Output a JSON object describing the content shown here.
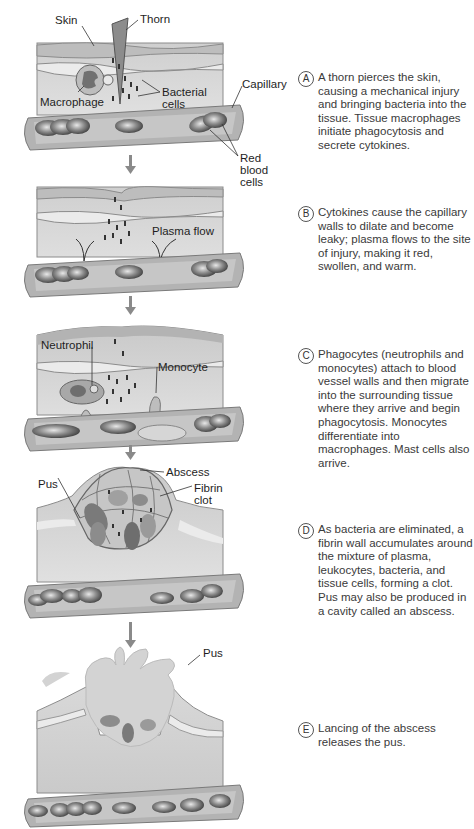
{
  "steps": [
    {
      "letter": "A",
      "text": "A thorn pierces the skin, causing a mechanical injury and bringing bacteria into the tissue. Tissue macrophages initiate phagocytosis and secrete cytokines.",
      "labels": {
        "skin": "Skin",
        "thorn": "Thorn",
        "macrophage": "Macrophage",
        "bacterial_cells": "Bacterial\ncells",
        "capillary": "Capillary",
        "red_blood_cells": "Red blood\ncells"
      }
    },
    {
      "letter": "B",
      "text": "Cytokines cause the capillary walls to dilate and become leaky; plasma flows to the site of injury, making it red, swollen, and warm.",
      "labels": {
        "plasma_flow": "Plasma flow"
      }
    },
    {
      "letter": "C",
      "text": "Phagocytes (neutrophils and monocytes) attach to blood vessel walls and then migrate into the surrounding tissue where they arrive and begin phagocytosis. Monocytes differentiate into macrophages. Mast cells also arrive.",
      "labels": {
        "neutrophil": "Neutrophil",
        "monocyte": "Monocyte"
      }
    },
    {
      "letter": "D",
      "text": "As bacteria are eliminated, a fibrin wall accumulates around the mixture of plasma, leukocytes, bacteria, and tissue cells, forming a clot. Pus may also be produced in a cavity called an abscess.",
      "labels": {
        "pus": "Pus",
        "abscess": "Abscess",
        "fibrin_clot": "Fibrin\nclot"
      }
    },
    {
      "letter": "E",
      "text": "Lancing of the abscess releases the pus.",
      "labels": {
        "pus": "Pus"
      }
    }
  ],
  "colors": {
    "tissue": "#d4d4d4",
    "skin_band": "#9a9a9a",
    "vessel": "#a9a9a9",
    "rbc": "#5a5a5a",
    "pus": "#d9d9d9",
    "arrow": "#8a8a8a"
  }
}
